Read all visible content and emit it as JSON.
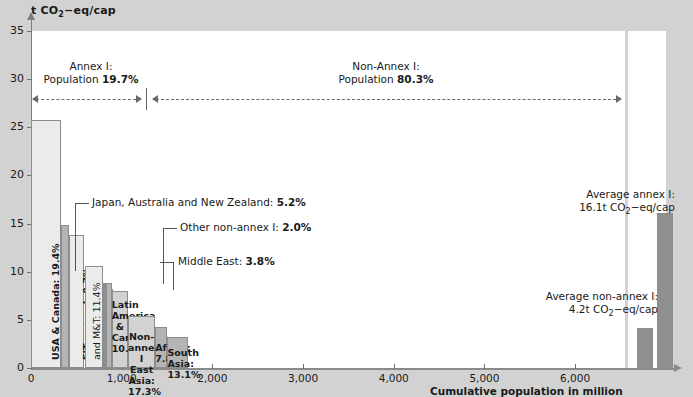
{
  "chart_data": {
    "type": "bar",
    "title": "",
    "ylabel": "t CO2-eq/cap",
    "ylabel_parts": {
      "pre": "t CO",
      "sub": "2",
      "post": "−eq/cap"
    },
    "xlabel": "Cumulative population in million",
    "ylim": [
      0,
      35
    ],
    "xlim": [
      0,
      6550
    ],
    "yticks": [
      0,
      5,
      10,
      15,
      20,
      25,
      30,
      35
    ],
    "ytick_labels": [
      "0",
      "5",
      "10",
      "15",
      "20",
      "25",
      "30",
      "35"
    ],
    "xticks": [
      0,
      1000,
      2000,
      3000,
      4000,
      5000,
      6000
    ],
    "xtick_labels": [
      "0",
      "1,000",
      "2,000",
      "3,000",
      "4,000",
      "5,000",
      "6,000"
    ],
    "grid": false,
    "legend": "none",
    "note": "Variable-width bars: width = cumulative population share, height = per-capita emissions",
    "bars": [
      {
        "name": "USA & Canada",
        "label": "USA & Canada: 19.4%",
        "pop_pct": "19.4%",
        "x_start": 0,
        "x_end": 330,
        "value": 25.8,
        "fill": "#ebebeb",
        "label_mode": "vertical-inside"
      },
      {
        "name": "Japan, Australia and New Zealand",
        "label": "Japan, Australia and New Zealand: 5.2%",
        "pop_pct": "5.2%",
        "x_start": 330,
        "x_end": 420,
        "value": 14.8,
        "fill": "#b4b4b4",
        "label_mode": "callout"
      },
      {
        "name": "EIT annex I",
        "label": "EIT annex I: 9.7%",
        "pop_pct": "9.7%",
        "x_start": 420,
        "x_end": 590,
        "value": 13.8,
        "fill": "#ebebeb",
        "label_mode": "vertical-inside"
      },
      {
        "name": "Europe annex I and M&T",
        "label": "Europe annex I and M&T: 11.4%",
        "pop_pct": "11.4%",
        "x_start": 590,
        "x_end": 790,
        "value": 10.6,
        "fill": "#ebebeb",
        "label_mode": "vertical-inside"
      },
      {
        "name": "Other non-annex I",
        "label": "Other non-annex I: 2.0%",
        "pop_pct": "2.0%",
        "x_start": 790,
        "x_end": 825,
        "value": 8.8,
        "fill": "#8f8f8f",
        "label_mode": "callout"
      },
      {
        "name": "Middle East",
        "label": "Middle East: 3.8%",
        "pop_pct": "3.8%",
        "x_start": 825,
        "x_end": 890,
        "value": 8.8,
        "fill": "#b4b4b4",
        "label_mode": "callout"
      },
      {
        "name": "Latin America & Carribean",
        "label": "Latin America & Carribean: 10.3%",
        "pop_pct": "10.3%",
        "x_start": 890,
        "x_end": 1070,
        "value": 8.0,
        "fill": "#d2d2d2",
        "label_mode": "horizontal-inside"
      },
      {
        "name": "Non-annex I East Asia",
        "label": "Non-annex I East Asia: 17.3%",
        "pop_pct": "17.3%",
        "x_start": 1070,
        "x_end": 1370,
        "value": 5.4,
        "fill": "#d2d2d2",
        "label_mode": "horizontal-inside"
      },
      {
        "name": "Africa",
        "label": "Africa: 7.8%",
        "pop_pct": "7.8%",
        "x_start": 1370,
        "x_end": 1505,
        "value": 4.3,
        "fill": "#b4b4b4",
        "label_mode": "horizontal-inside"
      },
      {
        "name": "South Asia",
        "label": "South Asia: 13.1%",
        "pop_pct": "13.1%",
        "x_start": 1505,
        "x_end": 1735,
        "value": 3.2,
        "fill": "#b4b4b4",
        "label_mode": "horizontal-inside"
      }
    ],
    "average_bars": [
      {
        "name": "Average non-annex I",
        "value": 4.2,
        "label_line1": "Average non-annex I:",
        "label_line2": "4.2t CO2−eq/cap",
        "fill": "#8f8f8f"
      },
      {
        "name": "Average annex I",
        "value": 16.1,
        "label_line1": "Average annex I:",
        "label_line2": "16.1t CO2−eq/cap",
        "fill": "#8f8f8f"
      }
    ],
    "annotations": [
      {
        "id": "annex-bracket",
        "line1": "Annex I:",
        "line2_pre": "Population ",
        "line2_bold": "19.7%"
      },
      {
        "id": "nonannex-bracket",
        "line1": "Non-Annex I:",
        "line2_pre": "Population ",
        "line2_bold": "80.3%"
      }
    ]
  },
  "labels": {
    "yaxis_pre": "t CO",
    "yaxis_sub": "2",
    "yaxis_post": "−eq/cap",
    "xaxis_title": "Cumulative population in million",
    "callout_japan_pre": "Japan, Australia and New Zealand: ",
    "callout_japan_bold": "5.2%",
    "callout_other_pre": "Other non-annex I: ",
    "callout_other_bold": "2.0%",
    "callout_middle_pre": "Middle East: ",
    "callout_middle_bold": "3.8%",
    "bar_usa": "USA & Canada: 19.4%",
    "bar_eit": "EIT annex I: 9.7%",
    "bar_europe_l1": "Europe annex I",
    "bar_europe_l2": "and M&T: 11.4%",
    "bar_latin_l1": "Latin",
    "bar_latin_l2": "America",
    "bar_latin_l3": "&",
    "bar_latin_l4": "Carribean:",
    "bar_latin_l5": "10.3%",
    "bar_eastasia_l1": "Non-annex I",
    "bar_eastasia_l2": "East Asia: 17.3%",
    "bar_africa": "Africa: 7.8%",
    "bar_southasia": "South Asia: 13.1%",
    "avg_annex_l1": "Average annex I:",
    "avg_annex_l2_pre": "16.1t CO",
    "avg_annex_l2_sub": "2",
    "avg_annex_l2_post": "−eq/cap",
    "avg_nonannex_l1": "Average non-annex I:",
    "avg_nonannex_l2_pre": "4.2t CO",
    "avg_nonannex_l2_sub": "2",
    "avg_nonannex_l2_post": "−eq/cap",
    "brk_annex_l1": "Annex I:",
    "brk_annex_l2_pre": "Population ",
    "brk_annex_l2_bold": "19.7%",
    "brk_nonannex_l1": "Non-Annex I:",
    "brk_nonannex_l2_pre": "Population ",
    "brk_nonannex_l2_bold": "80.3%"
  },
  "ytick_labels": [
    "0",
    "5",
    "10",
    "15",
    "20",
    "25",
    "30",
    "35"
  ],
  "xtick_labels": [
    "0",
    "1,000",
    "2,000",
    "3,000",
    "4,000",
    "5,000",
    "6,000"
  ],
  "colors": {
    "page_bg": "#d2d2d2",
    "plot_bg": "#ffffff",
    "bar_light": "#ebebeb",
    "bar_mid": "#b4b4b4",
    "bar_dark": "#8f8f8f",
    "bar_grey": "#d2d2d2",
    "axis": "#7d7d7d"
  }
}
